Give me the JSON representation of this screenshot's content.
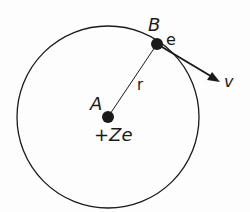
{
  "diagram": {
    "labels": {
      "nucleus_point": "A",
      "electron_point": "B",
      "electron_charge": "e",
      "radius": "r",
      "velocity": "v",
      "nucleus_charge": "+Ze"
    },
    "colors": {
      "stroke": "#1a1a1a",
      "background": "#fdfdfd"
    }
  }
}
